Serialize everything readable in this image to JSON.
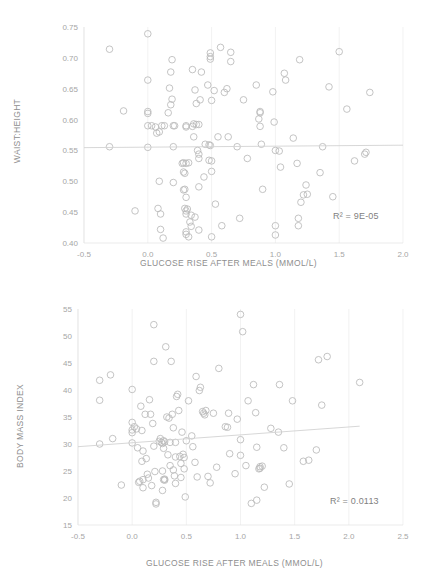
{
  "chart_data": [
    {
      "id": "waist-height-vs-glucose",
      "type": "scatter",
      "title": "",
      "xlabel": "GLUCOSE RISE AFTER MEALS (MMOL/L)",
      "ylabel": "WAIST:HEIGHT",
      "xlim": [
        -0.5,
        2.0
      ],
      "ylim": [
        0.4,
        0.75
      ],
      "xticks": [
        "-0.5",
        "0.0",
        "0.5",
        "1.0",
        "1.5",
        "2.0"
      ],
      "xtick_values": [
        -0.5,
        0.0,
        0.5,
        1.0,
        1.5,
        2.0
      ],
      "yticks": [
        "0.40",
        "0.45",
        "0.50",
        "0.55",
        "0.60",
        "0.65",
        "0.70",
        "0.75"
      ],
      "ytick_values": [
        0.4,
        0.45,
        0.5,
        0.55,
        0.6,
        0.65,
        0.7,
        0.75
      ],
      "grid": "vertical",
      "legend": "none",
      "annotation": "R² = 9E-05",
      "r_squared": "9E-05",
      "trendline": {
        "x0": -0.5,
        "y0": 0.5545,
        "x1": 2.0,
        "y1": 0.5585
      },
      "marker": {
        "shape": "open-circle",
        "size": 4.4,
        "color": "#b9b9b9"
      },
      "points": [
        [
          -0.3,
          0.714
        ],
        [
          -0.3,
          0.556
        ],
        [
          -0.19,
          0.614
        ],
        [
          -0.1,
          0.452
        ],
        [
          0.0,
          0.739
        ],
        [
          0.0,
          0.664
        ],
        [
          0.0,
          0.613
        ],
        [
          0.0,
          0.61
        ],
        [
          0.0,
          0.59
        ],
        [
          0.0,
          0.555
        ],
        [
          0.03,
          0.59
        ],
        [
          0.06,
          0.588
        ],
        [
          0.07,
          0.578
        ],
        [
          0.08,
          0.456
        ],
        [
          0.09,
          0.5
        ],
        [
          0.09,
          0.58
        ],
        [
          0.1,
          0.447
        ],
        [
          0.1,
          0.422
        ],
        [
          0.11,
          0.59
        ],
        [
          0.12,
          0.408
        ],
        [
          0.13,
          0.59
        ],
        [
          0.16,
          0.611
        ],
        [
          0.17,
          0.651
        ],
        [
          0.18,
          0.677
        ],
        [
          0.18,
          0.624
        ],
        [
          0.19,
          0.697
        ],
        [
          0.19,
          0.633
        ],
        [
          0.2,
          0.59
        ],
        [
          0.2,
          0.556
        ],
        [
          0.2,
          0.498
        ],
        [
          0.21,
          0.59
        ],
        [
          0.27,
          0.529
        ],
        [
          0.28,
          0.53
        ],
        [
          0.28,
          0.515
        ],
        [
          0.28,
          0.486
        ],
        [
          0.29,
          0.513
        ],
        [
          0.29,
          0.487
        ],
        [
          0.29,
          0.456
        ],
        [
          0.3,
          0.59
        ],
        [
          0.3,
          0.588
        ],
        [
          0.3,
          0.529
        ],
        [
          0.3,
          0.474
        ],
        [
          0.3,
          0.452
        ],
        [
          0.3,
          0.447
        ],
        [
          0.3,
          0.418
        ],
        [
          0.3,
          0.414
        ],
        [
          0.31,
          0.455
        ],
        [
          0.32,
          0.53
        ],
        [
          0.32,
          0.41
        ],
        [
          0.33,
          0.434
        ],
        [
          0.34,
          0.445
        ],
        [
          0.34,
          0.427
        ],
        [
          0.35,
          0.681
        ],
        [
          0.35,
          0.589
        ],
        [
          0.36,
          0.593
        ],
        [
          0.36,
          0.572
        ],
        [
          0.37,
          0.648
        ],
        [
          0.37,
          0.442
        ],
        [
          0.38,
          0.626
        ],
        [
          0.38,
          0.592
        ],
        [
          0.39,
          0.55
        ],
        [
          0.4,
          0.592
        ],
        [
          0.4,
          0.544
        ],
        [
          0.4,
          0.537
        ],
        [
          0.4,
          0.491
        ],
        [
          0.4,
          0.421
        ],
        [
          0.41,
          0.632
        ],
        [
          0.42,
          0.677
        ],
        [
          0.44,
          0.507
        ],
        [
          0.45,
          0.56
        ],
        [
          0.47,
          0.656
        ],
        [
          0.48,
          0.559
        ],
        [
          0.48,
          0.534
        ],
        [
          0.49,
          0.702
        ],
        [
          0.49,
          0.698
        ],
        [
          0.49,
          0.708
        ],
        [
          0.49,
          0.558
        ],
        [
          0.5,
          0.631
        ],
        [
          0.5,
          0.533
        ],
        [
          0.5,
          0.516
        ],
        [
          0.5,
          0.41
        ],
        [
          0.52,
          0.647
        ],
        [
          0.53,
          0.463
        ],
        [
          0.55,
          0.572
        ],
        [
          0.57,
          0.717
        ],
        [
          0.58,
          0.428
        ],
        [
          0.6,
          0.644
        ],
        [
          0.62,
          0.65
        ],
        [
          0.63,
          0.572
        ],
        [
          0.65,
          0.694
        ],
        [
          0.65,
          0.709
        ],
        [
          0.7,
          0.556
        ],
        [
          0.72,
          0.44
        ],
        [
          0.75,
          0.632
        ],
        [
          0.78,
          0.537
        ],
        [
          0.85,
          0.656
        ],
        [
          0.87,
          0.601
        ],
        [
          0.88,
          0.611
        ],
        [
          0.88,
          0.613
        ],
        [
          0.88,
          0.589
        ],
        [
          0.89,
          0.56
        ],
        [
          0.9,
          0.487
        ],
        [
          0.98,
          0.645
        ],
        [
          0.99,
          0.596
        ],
        [
          1.0,
          0.55
        ],
        [
          1.0,
          0.428
        ],
        [
          1.0,
          0.413
        ],
        [
          1.03,
          0.549
        ],
        [
          1.04,
          0.523
        ],
        [
          1.07,
          0.675
        ],
        [
          1.08,
          0.664
        ],
        [
          1.14,
          0.57
        ],
        [
          1.17,
          0.529
        ],
        [
          1.18,
          0.44
        ],
        [
          1.18,
          0.428
        ],
        [
          1.19,
          0.697
        ],
        [
          1.2,
          0.466
        ],
        [
          1.22,
          0.478
        ],
        [
          1.24,
          0.494
        ],
        [
          1.25,
          0.479
        ],
        [
          1.35,
          0.514
        ],
        [
          1.37,
          0.556
        ],
        [
          1.42,
          0.653
        ],
        [
          1.45,
          0.475
        ],
        [
          1.5,
          0.71
        ],
        [
          1.56,
          0.617
        ],
        [
          1.62,
          0.533
        ],
        [
          1.7,
          0.544
        ],
        [
          1.71,
          0.547
        ],
        [
          1.74,
          0.644
        ]
      ]
    },
    {
      "id": "bmi-vs-glucose",
      "type": "scatter",
      "title": "",
      "xlabel": "GLUCOSE RISE AFTER MEALS (MMOL/L)",
      "ylabel": "BODY MASS INDEX",
      "xlim": [
        -0.5,
        2.5
      ],
      "ylim": [
        15,
        55
      ],
      "xticks": [
        "-0.5",
        "0.0",
        "0.5",
        "1.0",
        "1.5",
        "2.0",
        "2.5"
      ],
      "xtick_values": [
        -0.5,
        0.0,
        0.5,
        1.0,
        1.5,
        2.0,
        2.5
      ],
      "yticks": [
        "15",
        "20",
        "25",
        "30",
        "35",
        "40",
        "45",
        "50",
        "55"
      ],
      "ytick_values": [
        15,
        20,
        25,
        30,
        35,
        40,
        45,
        50,
        55
      ],
      "grid": "vertical",
      "legend": "none",
      "annotation": "R² = 0.0113",
      "r_squared": "0.0113",
      "trendline": {
        "x0": -0.5,
        "y0": 29.5,
        "x1": 2.1,
        "y1": 33.3
      },
      "marker": {
        "shape": "open-circle",
        "size": 4.4,
        "color": "#b9b9b9"
      },
      "points": [
        [
          -0.3,
          41.8
        ],
        [
          -0.3,
          38.1
        ],
        [
          -0.3,
          30.0
        ],
        [
          -0.2,
          42.8
        ],
        [
          -0.18,
          31.0
        ],
        [
          -0.1,
          22.4
        ],
        [
          0.0,
          40.1
        ],
        [
          0.0,
          34.0
        ],
        [
          0.0,
          32.6
        ],
        [
          0.0,
          32.1
        ],
        [
          0.0,
          30.2
        ],
        [
          0.02,
          33.2
        ],
        [
          0.04,
          32.8
        ],
        [
          0.05,
          29.3
        ],
        [
          0.06,
          22.9
        ],
        [
          0.07,
          23.1
        ],
        [
          0.08,
          37.0
        ],
        [
          0.09,
          32.5
        ],
        [
          0.09,
          26.8
        ],
        [
          0.1,
          28.7
        ],
        [
          0.1,
          23.4
        ],
        [
          0.1,
          21.9
        ],
        [
          0.12,
          35.5
        ],
        [
          0.13,
          27.3
        ],
        [
          0.14,
          24.4
        ],
        [
          0.15,
          23.7
        ],
        [
          0.16,
          38.2
        ],
        [
          0.17,
          35.5
        ],
        [
          0.18,
          22.3
        ],
        [
          0.19,
          33.8
        ],
        [
          0.2,
          45.3
        ],
        [
          0.2,
          52.1
        ],
        [
          0.2,
          29.6
        ],
        [
          0.21,
          24.9
        ],
        [
          0.22,
          19.2
        ],
        [
          0.22,
          18.9
        ],
        [
          0.25,
          30.5
        ],
        [
          0.26,
          31.0
        ],
        [
          0.27,
          30.3
        ],
        [
          0.28,
          30.1
        ],
        [
          0.28,
          25.0
        ],
        [
          0.28,
          21.4
        ],
        [
          0.29,
          30.6
        ],
        [
          0.29,
          29.2
        ],
        [
          0.29,
          23.4
        ],
        [
          0.3,
          30.4
        ],
        [
          0.3,
          23.3
        ],
        [
          0.3,
          23.5
        ],
        [
          0.31,
          48.0
        ],
        [
          0.32,
          35.0
        ],
        [
          0.33,
          28.0
        ],
        [
          0.34,
          34.8
        ],
        [
          0.35,
          30.3
        ],
        [
          0.35,
          26.0
        ],
        [
          0.36,
          45.3
        ],
        [
          0.37,
          35.5
        ],
        [
          0.38,
          33.0
        ],
        [
          0.38,
          25.2
        ],
        [
          0.39,
          24.1
        ],
        [
          0.4,
          30.3
        ],
        [
          0.4,
          27.6
        ],
        [
          0.4,
          22.7
        ],
        [
          0.41,
          38.8
        ],
        [
          0.42,
          39.2
        ],
        [
          0.43,
          36.2
        ],
        [
          0.44,
          27.7
        ],
        [
          0.45,
          26.4
        ],
        [
          0.45,
          23.8
        ],
        [
          0.46,
          32.2
        ],
        [
          0.47,
          28.1
        ],
        [
          0.48,
          27.5
        ],
        [
          0.48,
          25.4
        ],
        [
          0.49,
          20.2
        ],
        [
          0.5,
          30.6
        ],
        [
          0.52,
          38.0
        ],
        [
          0.55,
          31.5
        ],
        [
          0.56,
          29.5
        ],
        [
          0.58,
          26.6
        ],
        [
          0.59,
          42.5
        ],
        [
          0.6,
          23.9
        ],
        [
          0.62,
          39.9
        ],
        [
          0.63,
          40.5
        ],
        [
          0.65,
          36.0
        ],
        [
          0.66,
          35.7
        ],
        [
          0.67,
          35.4
        ],
        [
          0.68,
          36.2
        ],
        [
          0.7,
          24.0
        ],
        [
          0.72,
          22.8
        ],
        [
          0.75,
          35.7
        ],
        [
          0.78,
          25.7
        ],
        [
          0.8,
          44.0
        ],
        [
          0.86,
          33.2
        ],
        [
          0.88,
          33.1
        ],
        [
          0.89,
          35.7
        ],
        [
          0.9,
          28.2
        ],
        [
          0.95,
          24.5
        ],
        [
          0.97,
          34.6
        ],
        [
          1.0,
          54.0
        ],
        [
          1.0,
          30.8
        ],
        [
          1.0,
          27.9
        ],
        [
          1.02,
          50.8
        ],
        [
          1.05,
          26.0
        ],
        [
          1.07,
          38.0
        ],
        [
          1.1,
          19.0
        ],
        [
          1.12,
          41.0
        ],
        [
          1.14,
          35.8
        ],
        [
          1.15,
          29.4
        ],
        [
          1.15,
          19.6
        ],
        [
          1.17,
          25.4
        ],
        [
          1.18,
          25.5
        ],
        [
          1.18,
          25.8
        ],
        [
          1.2,
          25.9
        ],
        [
          1.22,
          22.0
        ],
        [
          1.28,
          32.9
        ],
        [
          1.35,
          32.2
        ],
        [
          1.36,
          41.0
        ],
        [
          1.4,
          29.3
        ],
        [
          1.45,
          22.6
        ],
        [
          1.48,
          38.0
        ],
        [
          1.58,
          26.8
        ],
        [
          1.63,
          27.0
        ],
        [
          1.7,
          28.9
        ],
        [
          1.72,
          45.6
        ],
        [
          1.75,
          37.2
        ],
        [
          1.8,
          46.2
        ],
        [
          2.1,
          41.4
        ]
      ]
    }
  ],
  "colors": {
    "marker": "#b9b9b9",
    "trendline": "#d3d3d3",
    "gridline": "#ededed",
    "tick_text": "#a6a6a6",
    "title_text": "#8e8e8e",
    "annotation_text": "#7f7f7f",
    "background": "#ffffff"
  }
}
